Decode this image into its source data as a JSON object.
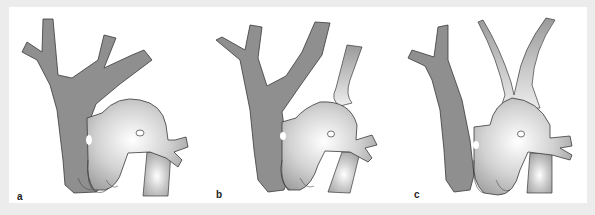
{
  "figure": {
    "panels": [
      {
        "id": "a",
        "label": "a"
      },
      {
        "id": "b",
        "label": "b"
      },
      {
        "id": "c",
        "label": "c"
      }
    ],
    "colors": {
      "background_outer": "#ececec",
      "background_panel": "#ffffff",
      "dark_structure_fill": "#8f8f8f",
      "outline": "#3a3a3a",
      "light_structure_highlight": "#ffffff",
      "light_structure_edge": "#9c9c9c"
    }
  }
}
